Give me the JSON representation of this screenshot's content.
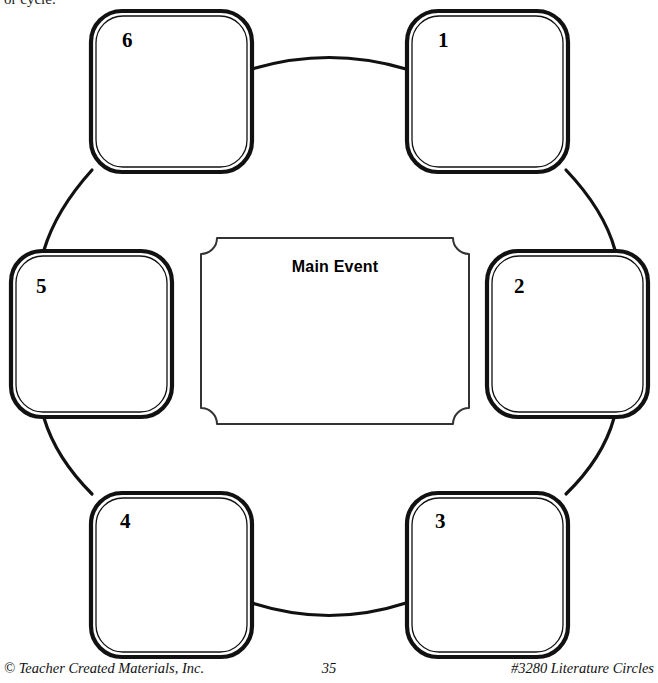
{
  "page": {
    "intro_text": "or cycle.",
    "background_color": "#ffffff",
    "line_color": "#111111"
  },
  "organizer": {
    "center": {
      "title": "Main Event",
      "shape": "concave-corner-plaque"
    },
    "steps": [
      {
        "label": "1",
        "position": "top-right"
      },
      {
        "label": "2",
        "position": "right"
      },
      {
        "label": "3",
        "position": "bottom-right"
      },
      {
        "label": "4",
        "position": "bottom-left"
      },
      {
        "label": "5",
        "position": "left"
      },
      {
        "label": "6",
        "position": "top-left"
      }
    ]
  },
  "footer": {
    "copyright": "© Teacher Created Materials, Inc.",
    "page_number": "35",
    "product": "#3280 Literature Circles"
  }
}
